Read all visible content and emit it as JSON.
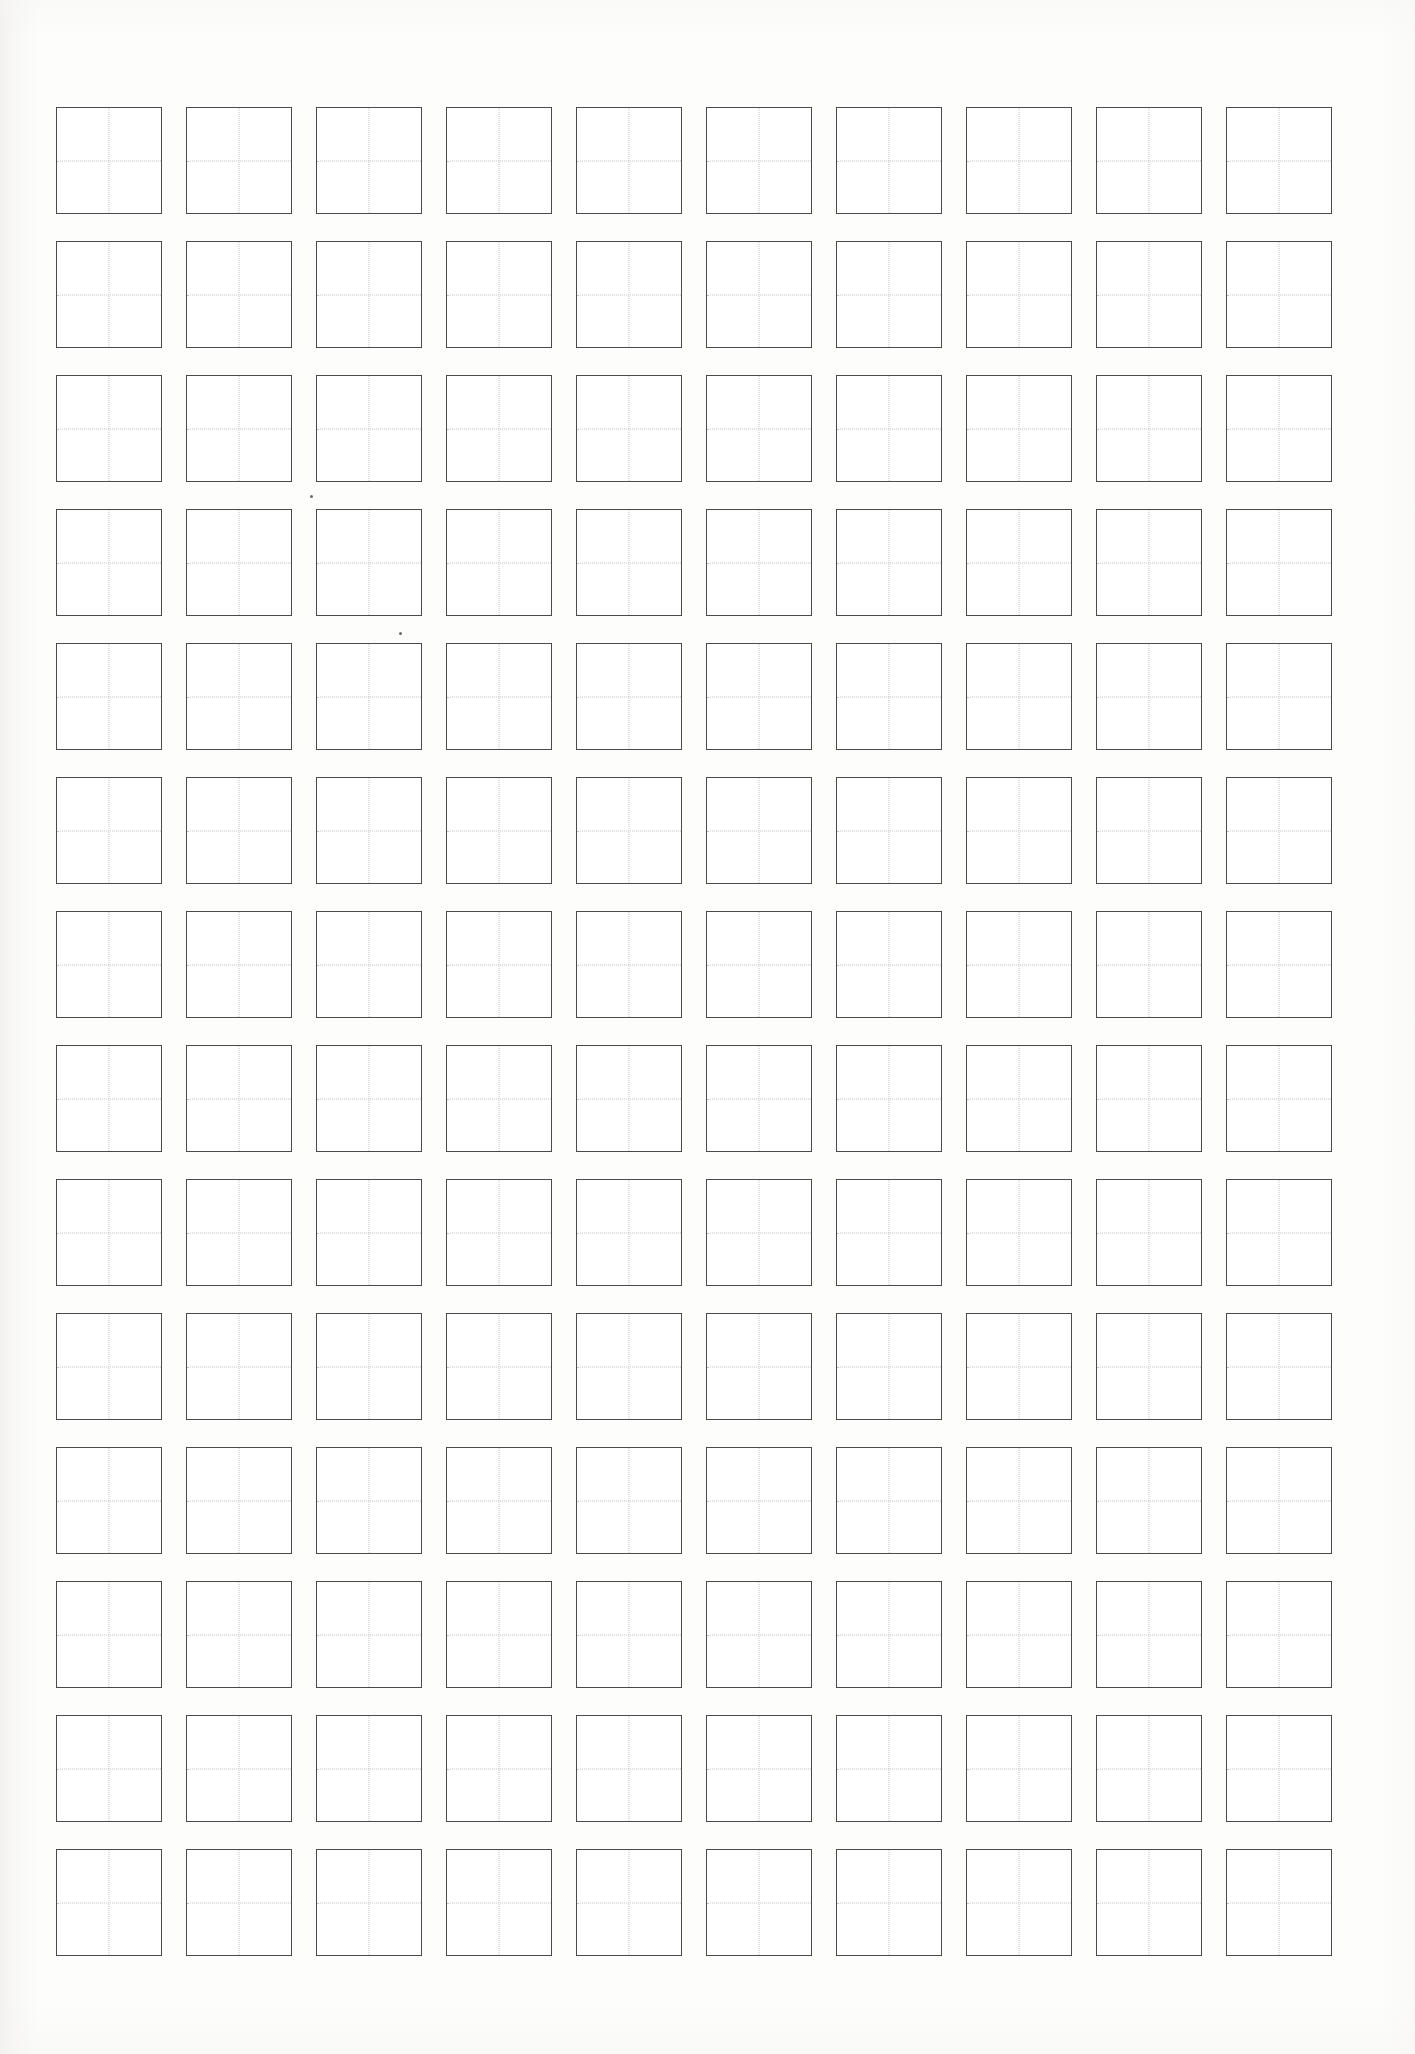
{
  "document": {
    "kind": "worksheet",
    "sheet_name": "tianzige-character-practice-sheet",
    "paper_color": "#fdfdfc",
    "page_width": 1415,
    "page_height": 2054
  },
  "grid": {
    "rows": 14,
    "columns": 10,
    "cell_width": 106,
    "cell_height": 107,
    "column_pitch": 130,
    "row_pitch": 134,
    "origin_x": 56,
    "origin_y": 107,
    "border_color": "#4a4a4a",
    "border_width": 1.6,
    "guide_color": "#c2c2c2",
    "guide_style": "dotted",
    "cell_fill": "#ffffff",
    "cell_content": [
      "",
      "",
      "",
      "",
      "",
      "",
      "",
      "",
      "",
      ""
    ]
  },
  "artifacts": [
    {
      "name": "scan-speck",
      "x": 310,
      "y": 495
    },
    {
      "name": "scan-speck",
      "x": 399,
      "y": 632
    }
  ]
}
